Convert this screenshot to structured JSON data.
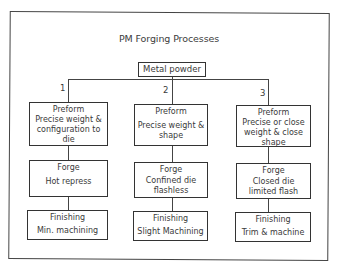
{
  "diagram": {
    "title": "PM Forging Processes",
    "root": {
      "label": "Metal powder"
    },
    "branches": [
      {
        "number": "1",
        "preform": {
          "heading": "Preform",
          "text": "Precise weight &\nconfiguration to\ndie"
        },
        "forge": {
          "heading": "Forge",
          "text": "Hot repress"
        },
        "finishing": {
          "heading": "Finishing",
          "text": "Min. machining"
        }
      },
      {
        "number": "2",
        "preform": {
          "heading": "Preform",
          "text": "Precise weight &\nshape"
        },
        "forge": {
          "heading": "Forge",
          "text": "Confined die\nflashless"
        },
        "finishing": {
          "heading": "Finishing",
          "text": "Slight Machining"
        }
      },
      {
        "number": "3",
        "preform": {
          "heading": "Preform",
          "text": "Precise or close\nweight & close\nshape"
        },
        "forge": {
          "heading": "Forge",
          "text": "Closed die\nlimited flash"
        },
        "finishing": {
          "heading": "Finishing",
          "text": "Trim & machine"
        }
      }
    ]
  }
}
